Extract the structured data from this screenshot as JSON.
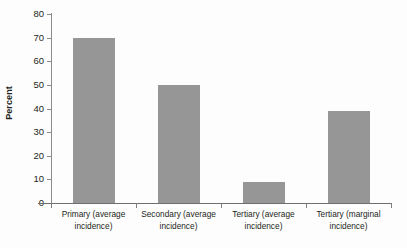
{
  "chart_data": {
    "type": "bar",
    "title": "",
    "subtitle": "",
    "xlabel": "",
    "ylabel": "Percent",
    "categories": [
      "Primary (average incidence)",
      "Secondary (average incidence)",
      "Tertiary (average incidence)",
      "Tertiary (marginal incidence)"
    ],
    "category_lines": [
      [
        "Primary (average",
        "incidence)"
      ],
      [
        "Secondary (average",
        "incidence)"
      ],
      [
        "Tertiary (average",
        "incidence)"
      ],
      [
        "Tertiary (marginal",
        "incidence)"
      ]
    ],
    "values": [
      70,
      50,
      9,
      39
    ],
    "ylim": [
      0,
      80
    ],
    "yticks": [
      0,
      10,
      20,
      30,
      40,
      50,
      60,
      70,
      80
    ],
    "ytick_labels": [
      "0",
      "10",
      "20",
      "30",
      "40",
      "50",
      "60",
      "70",
      "80"
    ],
    "grid": false,
    "legend": null,
    "bar_color": "#969696",
    "axis_color": "#7d7d7d",
    "text_color": "#231f20",
    "background": "#fdfdfd"
  }
}
